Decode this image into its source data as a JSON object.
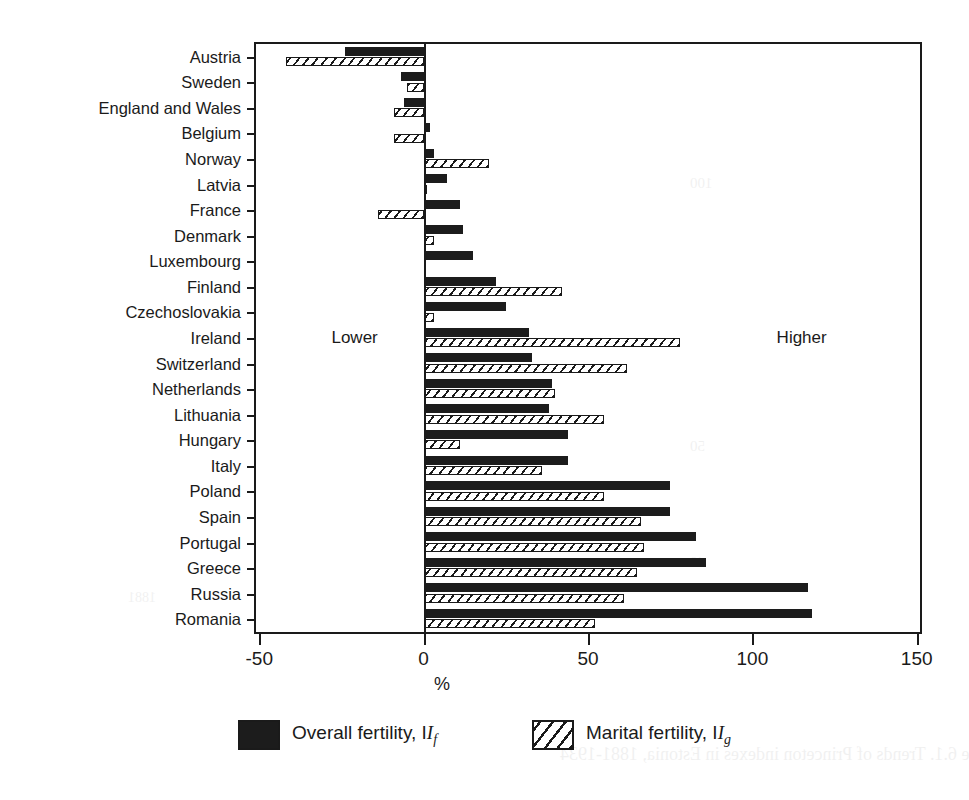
{
  "chart_data": {
    "type": "bar",
    "orientation": "horizontal",
    "title": "",
    "xlabel": "%",
    "ylabel": "",
    "xlim": [
      -51,
      151
    ],
    "xticks": [
      -50,
      0,
      50,
      100,
      150
    ],
    "xticklabels": [
      "-50",
      "0",
      "50",
      "100",
      "150"
    ],
    "grid": false,
    "legend_position": "bottom",
    "annotations": [
      {
        "text": "Lower",
        "x": -21,
        "y_row": 11
      },
      {
        "text": "Higher",
        "x": 115,
        "y_row": 11
      }
    ],
    "categories": [
      "Austria",
      "Sweden",
      "England and Wales",
      "Belgium",
      "Norway",
      "Latvia",
      "France",
      "Denmark",
      "Luxembourg",
      "Finland",
      "Czechoslovakia",
      "Ireland",
      "Switzerland",
      "Netherlands",
      "Lithuania",
      "Hungary",
      "Italy",
      "Poland",
      "Spain",
      "Portugal",
      "Greece",
      "Russia",
      "Romania"
    ],
    "series": [
      {
        "name": "Overall fertility, If",
        "label_plain": "Overall fertility, I",
        "label_sub": "f",
        "fill": "solid-black",
        "color": "#1c1c1c",
        "values": [
          -24,
          -7,
          -6,
          2,
          3,
          7,
          11,
          12,
          15,
          22,
          25,
          32,
          33,
          39,
          38,
          44,
          44,
          75,
          75,
          83,
          86,
          117,
          118
        ]
      },
      {
        "name": "Marital fertility, Ig",
        "label_plain": "Marital fertility, I",
        "label_sub": "g",
        "fill": "diagonal-hatch",
        "color": "#ffffff",
        "values": [
          -42,
          -5,
          -9,
          -9,
          20,
          1,
          -14,
          3,
          0,
          42,
          3,
          78,
          62,
          40,
          55,
          11,
          36,
          55,
          66,
          67,
          65,
          61,
          52
        ]
      }
    ]
  },
  "ghost": {
    "caption": "Figure 6.1.  Trends of Princeton indexes in Estonia, 1881-1934",
    "marks": [
      "100",
      "50",
      "40",
      "1881"
    ]
  }
}
